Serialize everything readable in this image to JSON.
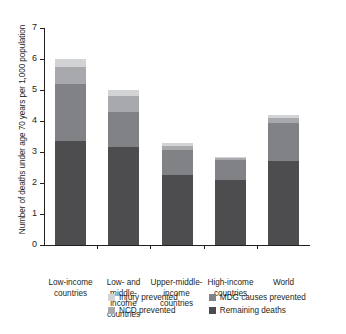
{
  "chart_data": {
    "type": "bar",
    "subtype": "stacked-bar",
    "title": "",
    "xlabel": "",
    "ylabel": "Number of deaths under age 70 years per 1,000 population",
    "ylim": [
      0,
      7
    ],
    "yticks": [
      0,
      1,
      2,
      3,
      4,
      5,
      6,
      7
    ],
    "ytick_labels": [
      "0",
      "1",
      "2",
      "3",
      "4",
      "5",
      "6",
      "7"
    ],
    "grid": false,
    "legend_position": "bottom",
    "categories": [
      "Low-income countries",
      "Low- and middle-income countries",
      "Upper-middle-income countries",
      "High-income countries",
      "World"
    ],
    "category_lines": [
      [
        "Low-income",
        "countries"
      ],
      [
        "Low- and",
        "middle-income",
        "countries"
      ],
      [
        "Upper-middle-",
        "income",
        "countries"
      ],
      [
        "High-income",
        "countries"
      ],
      [
        "World"
      ]
    ],
    "series": [
      {
        "name": "Remaining deaths",
        "color": "#4d4d4f",
        "values": [
          3.35,
          3.15,
          2.25,
          2.1,
          2.7
        ]
      },
      {
        "name": "MDG causes prevented",
        "color": "#808285",
        "values": [
          1.85,
          1.15,
          0.8,
          0.65,
          1.25
        ]
      },
      {
        "name": "NCD prevented",
        "color": "#a7a9ac",
        "values": [
          0.55,
          0.5,
          0.15,
          0.05,
          0.15
        ]
      },
      {
        "name": "Injury prevented",
        "color": "#d1d3d4",
        "values": [
          0.25,
          0.2,
          0.1,
          0.05,
          0.1
        ]
      }
    ],
    "totals": [
      6.0,
      5.0,
      3.3,
      2.85,
      4.2
    ]
  },
  "legend": {
    "items": [
      {
        "label": "Injury prevented",
        "color": "#d1d3d4"
      },
      {
        "label": "MDG causes prevented",
        "color": "#808285"
      },
      {
        "label": "NCD prevented",
        "color": "#a7a9ac"
      },
      {
        "label": "Remaining deaths",
        "color": "#4d4d4f"
      }
    ]
  }
}
